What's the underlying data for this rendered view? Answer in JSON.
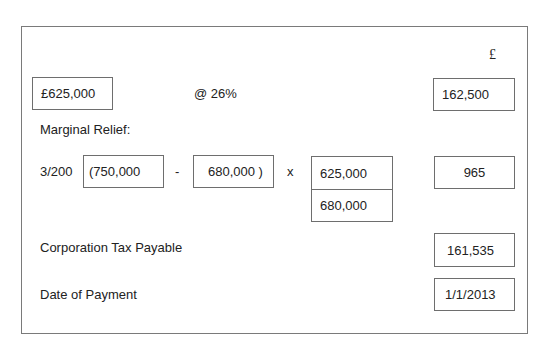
{
  "header": {
    "currency_symbol": "£"
  },
  "rate_row": {
    "profits": "£625,000",
    "rate": "@ 26%",
    "tax_at_rate": "162,500"
  },
  "marginal_relief": {
    "label": "Marginal Relief:",
    "fraction": "3/200",
    "upper_limit": "(750,000",
    "minus": "-",
    "profits": "680,000 )",
    "times": "x",
    "numerator": "625,000",
    "denominator": "680,000",
    "result": "965"
  },
  "tax_payable": {
    "label": "Corporation Tax Payable",
    "value": "161,535"
  },
  "payment_date": {
    "label": "Date of Payment",
    "value": "1/1/2013"
  }
}
